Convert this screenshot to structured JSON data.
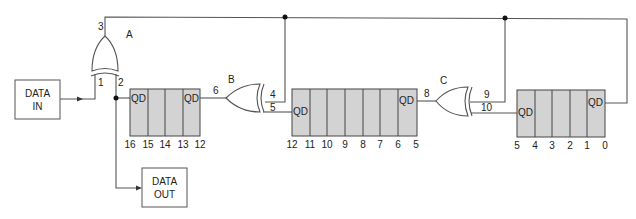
{
  "diagram": {
    "type": "LFSR / XOR feedback shift register circuit",
    "io_blocks": {
      "data_in": [
        "DATA",
        "IN"
      ],
      "data_out": [
        "DATA",
        "OUT"
      ]
    },
    "gates": [
      {
        "id": "A",
        "type": "XOR",
        "inputs": [
          "1",
          "2"
        ],
        "output": "3"
      },
      {
        "id": "B",
        "type": "XOR",
        "inputs": [
          "4",
          "5"
        ],
        "output": "6"
      },
      {
        "id": "C",
        "type": "XOR",
        "inputs": [
          "9",
          "10"
        ],
        "output": "8"
      }
    ],
    "registers": [
      {
        "name": "register-1",
        "stages": [
          "16",
          "15",
          "14",
          "13",
          "12"
        ],
        "qd_left": "QD",
        "qd_right": "QD"
      },
      {
        "name": "register-2",
        "stages": [
          "12",
          "11",
          "10",
          "9",
          "8",
          "7",
          "6",
          "5"
        ],
        "qd_left": "QD",
        "qd_right": "QD"
      },
      {
        "name": "register-3",
        "stages": [
          "5",
          "4",
          "3",
          "2",
          "1",
          "0"
        ],
        "qd_left": "QD",
        "qd_right": "QD"
      }
    ],
    "pin_labels": {
      "p1": "1",
      "p2": "2",
      "p3": "3",
      "p4": "4",
      "p5": "5",
      "p6": "6",
      "p8": "8",
      "p9": "9",
      "p10": "10"
    },
    "gate_labels": {
      "a": "A",
      "b": "B",
      "c": "C"
    }
  }
}
